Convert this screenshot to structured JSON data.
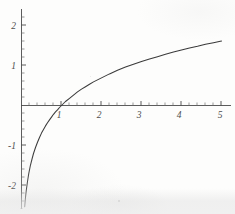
{
  "figure": {
    "title": "",
    "background_color": "#fdfdfc",
    "curve_color": "#3a3a3a",
    "axis_color": "#4a4a4a"
  },
  "chart_data": {
    "type": "line",
    "title": "",
    "subtitle": "",
    "xlabel": "",
    "ylabel": "",
    "function": "y = ln(x)",
    "xlim": [
      -0.05,
      5.35
    ],
    "ylim": [
      -2.6,
      2.45
    ],
    "grid": false,
    "legend": null,
    "legend_position": "none",
    "x_major_ticks": [
      1,
      2,
      3,
      4,
      5
    ],
    "x_major_tick_labels": [
      "1",
      "2",
      "3",
      "4",
      "5"
    ],
    "x_minor_tick_step": 0.2,
    "y_major_ticks": [
      -2,
      -1,
      1,
      2
    ],
    "y_major_tick_labels": [
      "-2",
      "-1",
      "1",
      "2"
    ],
    "y_minor_tick_step": 0.2,
    "x": [
      0.08,
      0.1,
      0.12,
      0.15,
      0.18,
      0.22,
      0.26,
      0.3,
      0.35,
      0.4,
      0.45,
      0.5,
      0.55,
      0.6,
      0.65,
      0.7,
      0.75,
      0.8,
      0.85,
      0.9,
      0.95,
      1.0,
      1.1,
      1.2,
      1.3,
      1.4,
      1.5,
      1.6,
      1.7,
      1.8,
      1.9,
      2.0,
      2.2,
      2.4,
      2.6,
      2.8,
      3.0,
      3.2,
      3.4,
      3.6,
      3.8,
      4.0,
      4.2,
      4.4,
      4.6,
      4.8,
      5.0
    ],
    "y": [
      -2.53,
      -2.3,
      -2.12,
      -1.9,
      -1.71,
      -1.51,
      -1.35,
      -1.2,
      -1.05,
      -0.92,
      -0.8,
      -0.69,
      -0.6,
      -0.51,
      -0.43,
      -0.36,
      -0.29,
      -0.22,
      -0.16,
      -0.11,
      -0.05,
      0.0,
      0.1,
      0.18,
      0.26,
      0.34,
      0.41,
      0.47,
      0.53,
      0.59,
      0.64,
      0.69,
      0.79,
      0.88,
      0.96,
      1.03,
      1.1,
      1.16,
      1.22,
      1.28,
      1.34,
      1.39,
      1.44,
      1.48,
      1.53,
      1.57,
      1.61
    ],
    "annotations": []
  },
  "axes": {
    "x_axis_name": "horizontal-axis",
    "y_axis_name": "vertical-axis",
    "origin_label": ""
  }
}
